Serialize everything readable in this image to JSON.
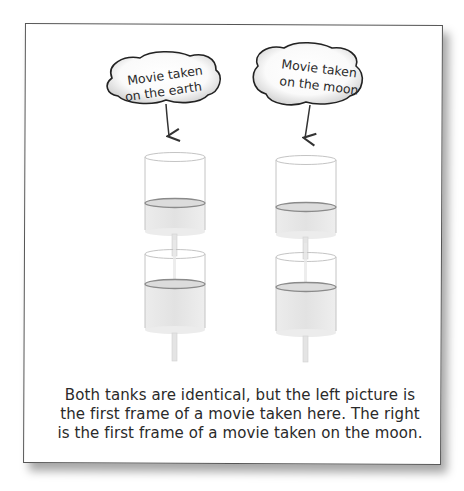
{
  "figure": {
    "bubbles": [
      {
        "id": "earth",
        "lines": [
          "Movie taken",
          "on the earth"
        ]
      },
      {
        "id": "moon",
        "lines": [
          "Movie taken",
          "on the moon"
        ]
      }
    ],
    "tanks": {
      "left": {
        "label": "earth",
        "upper_water_fraction": 0.37,
        "lower_water_fraction": 0.57
      },
      "right": {
        "label": "moon",
        "upper_water_fraction": 0.35,
        "lower_water_fraction": 0.57
      }
    },
    "caption": {
      "lines": [
        "Both tanks are identical, but the left picture is",
        "the first frame of a movie taken here.  The right",
        "is the first frame of a movie taken on the moon."
      ]
    },
    "colors": {
      "frame_border": "#555555",
      "text": "#2a2a2a",
      "water": "#e6e6e6",
      "tank_outline": "#bdbdbd",
      "water_surface": "#8a8a8a"
    }
  }
}
